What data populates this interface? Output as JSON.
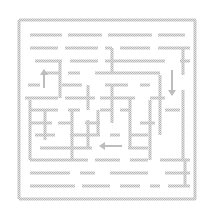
{
  "puzzle": {
    "type": "maze",
    "wall_color": "#c4c4c4",
    "background_color": "#ffffff",
    "wall_thickness": 3,
    "border": {
      "left": 19,
      "top": 20,
      "right": 195,
      "bottom": 199
    },
    "horizontal_walls": [
      {
        "y": 20,
        "x1": 19,
        "x2": 196
      },
      {
        "y": 199,
        "x1": 19,
        "x2": 196
      },
      {
        "y": 35,
        "x1": 30,
        "x2": 62
      },
      {
        "y": 35,
        "x1": 68,
        "x2": 102
      },
      {
        "y": 35,
        "x1": 108,
        "x2": 152
      },
      {
        "y": 35,
        "x1": 158,
        "x2": 185
      },
      {
        "y": 48,
        "x1": 30,
        "x2": 58
      },
      {
        "y": 48,
        "x1": 65,
        "x2": 98
      },
      {
        "y": 48,
        "x1": 105,
        "x2": 112
      },
      {
        "y": 48,
        "x1": 120,
        "x2": 150
      },
      {
        "y": 48,
        "x1": 158,
        "x2": 190
      },
      {
        "y": 61,
        "x1": 35,
        "x2": 62
      },
      {
        "y": 61,
        "x1": 70,
        "x2": 98
      },
      {
        "y": 61,
        "x1": 105,
        "x2": 165
      },
      {
        "y": 61,
        "x1": 180,
        "x2": 190
      },
      {
        "y": 73,
        "x1": 42,
        "x2": 60
      },
      {
        "y": 73,
        "x1": 68,
        "x2": 80
      },
      {
        "y": 73,
        "x1": 95,
        "x2": 160
      },
      {
        "y": 85,
        "x1": 28,
        "x2": 40
      },
      {
        "y": 85,
        "x1": 62,
        "x2": 82
      },
      {
        "y": 85,
        "x1": 105,
        "x2": 128
      },
      {
        "y": 85,
        "x1": 140,
        "x2": 150
      },
      {
        "y": 98,
        "x1": 25,
        "x2": 58
      },
      {
        "y": 98,
        "x1": 65,
        "x2": 95
      },
      {
        "y": 98,
        "x1": 100,
        "x2": 135
      },
      {
        "y": 98,
        "x1": 150,
        "x2": 165
      },
      {
        "y": 110,
        "x1": 30,
        "x2": 58
      },
      {
        "y": 110,
        "x1": 68,
        "x2": 80
      },
      {
        "y": 110,
        "x1": 100,
        "x2": 112
      },
      {
        "y": 110,
        "x1": 120,
        "x2": 130
      },
      {
        "y": 110,
        "x1": 165,
        "x2": 180
      },
      {
        "y": 123,
        "x1": 30,
        "x2": 52
      },
      {
        "y": 123,
        "x1": 58,
        "x2": 72
      },
      {
        "y": 123,
        "x1": 85,
        "x2": 100
      },
      {
        "y": 123,
        "x1": 140,
        "x2": 155
      },
      {
        "y": 135,
        "x1": 35,
        "x2": 55
      },
      {
        "y": 135,
        "x1": 70,
        "x2": 100
      },
      {
        "y": 135,
        "x1": 110,
        "x2": 120
      },
      {
        "y": 135,
        "x1": 130,
        "x2": 148
      },
      {
        "y": 148,
        "x1": 40,
        "x2": 92
      },
      {
        "y": 148,
        "x1": 128,
        "x2": 148
      },
      {
        "y": 160,
        "x1": 30,
        "x2": 88
      },
      {
        "y": 160,
        "x1": 95,
        "x2": 120
      },
      {
        "y": 160,
        "x1": 130,
        "x2": 148
      },
      {
        "y": 160,
        "x1": 160,
        "x2": 190
      },
      {
        "y": 173,
        "x1": 30,
        "x2": 70
      },
      {
        "y": 173,
        "x1": 80,
        "x2": 95
      },
      {
        "y": 173,
        "x1": 110,
        "x2": 148
      },
      {
        "y": 173,
        "x1": 165,
        "x2": 190
      },
      {
        "y": 186,
        "x1": 30,
        "x2": 75
      },
      {
        "y": 186,
        "x1": 82,
        "x2": 110
      },
      {
        "y": 186,
        "x1": 120,
        "x2": 140
      },
      {
        "y": 186,
        "x1": 150,
        "x2": 160
      },
      {
        "y": 186,
        "x1": 168,
        "x2": 190
      }
    ],
    "vertical_walls": [
      {
        "x": 19,
        "y1": 20,
        "y2": 199
      },
      {
        "x": 195,
        "y1": 20,
        "y2": 199
      },
      {
        "x": 30,
        "y1": 100,
        "y2": 160
      },
      {
        "x": 45,
        "y1": 110,
        "y2": 140
      },
      {
        "x": 60,
        "y1": 60,
        "y2": 98
      },
      {
        "x": 72,
        "y1": 110,
        "y2": 160
      },
      {
        "x": 88,
        "y1": 85,
        "y2": 110
      },
      {
        "x": 88,
        "y1": 120,
        "y2": 148
      },
      {
        "x": 98,
        "y1": 110,
        "y2": 135
      },
      {
        "x": 112,
        "y1": 48,
        "y2": 73
      },
      {
        "x": 112,
        "y1": 85,
        "y2": 123
      },
      {
        "x": 130,
        "y1": 98,
        "y2": 148
      },
      {
        "x": 150,
        "y1": 100,
        "y2": 160
      },
      {
        "x": 160,
        "y1": 75,
        "y2": 135
      },
      {
        "x": 183,
        "y1": 48,
        "y2": 75
      },
      {
        "x": 183,
        "y1": 90,
        "y2": 160
      },
      {
        "x": 185,
        "y1": 160,
        "y2": 186
      }
    ],
    "arrows": [
      {
        "name": "up-arrow",
        "direction": "up",
        "x1": 44,
        "y1": 88,
        "x2": 44,
        "y2": 70
      },
      {
        "name": "down-arrow",
        "direction": "down",
        "x1": 172,
        "y1": 70,
        "x2": 172,
        "y2": 95
      },
      {
        "name": "left-arrow",
        "direction": "left",
        "x1": 122,
        "y1": 146,
        "x2": 100,
        "y2": 146
      }
    ]
  }
}
